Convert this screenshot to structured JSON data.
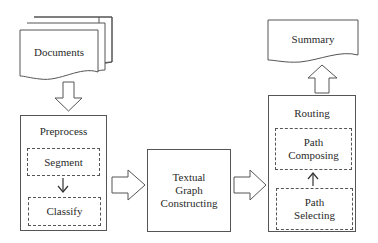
{
  "diagram": {
    "documents": {
      "label": "Documents"
    },
    "preprocess": {
      "title": "Preprocess",
      "steps": [
        "Segment",
        "Classify"
      ]
    },
    "textual_graph": {
      "lines": [
        "Textual",
        "Graph",
        "Constructing"
      ]
    },
    "routing": {
      "title": "Routing",
      "steps": [
        {
          "lines": [
            "Path",
            "Composing"
          ]
        },
        {
          "lines": [
            "Path",
            "Selecting"
          ]
        }
      ]
    },
    "summary": {
      "label": "Summary"
    },
    "colors": {
      "stroke": "#555555",
      "text": "#2a2a2a",
      "background": "#ffffff"
    }
  }
}
